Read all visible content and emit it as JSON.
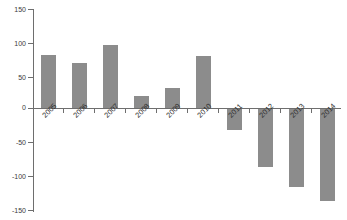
{
  "chart_data": {
    "type": "bar",
    "title": "",
    "subtitle": "",
    "xlabel": "",
    "ylabel": "",
    "categories": [
      "2005",
      "2006",
      "2007",
      "2008",
      "2009",
      "2010",
      "2011",
      "2012",
      "2013",
      "2014"
    ],
    "values": [
      78,
      66,
      92,
      18,
      29,
      76,
      -31,
      -85,
      -115,
      -136
    ],
    "series": [
      {
        "name": "",
        "values": [
          78,
          66,
          92,
          18,
          29,
          76,
          -31,
          -85,
          -115,
          -136
        ]
      }
    ],
    "ylim": [
      -150,
      150
    ],
    "ytick_labels": [
      "150",
      "100",
      "50",
      "0",
      "-50",
      "-100",
      "-150"
    ],
    "ytick_values": [
      150,
      100,
      50,
      0,
      -50,
      -100,
      -150
    ],
    "grid": false,
    "legend": null,
    "legend_position": "none",
    "bar_color": "#8c8c8c",
    "axis_color": "#6e6e6e",
    "background_color": "#ffffff",
    "xtick_label_rotation": -45
  }
}
